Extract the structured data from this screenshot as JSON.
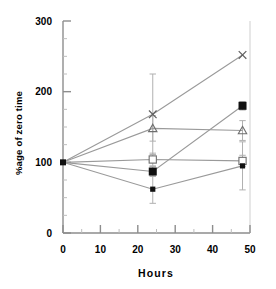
{
  "chart_data": {
    "type": "line",
    "title": "",
    "subtitle": "",
    "xlabel": "Hours",
    "ylabel": "%age of zero time",
    "xlim": [
      0,
      50
    ],
    "ylim": [
      0,
      300
    ],
    "xticks": [
      0,
      10,
      20,
      30,
      40,
      50
    ],
    "xtick_labels": [
      "0",
      "10",
      "20",
      "30",
      "40",
      "50"
    ],
    "yticks": [
      0,
      100,
      200,
      300
    ],
    "ytick_labels": [
      "0",
      "100",
      "200",
      "300"
    ],
    "minor_xticks": [
      5,
      15,
      25,
      35,
      45
    ],
    "minor_yticks": [
      25,
      50,
      75,
      125,
      150,
      175,
      225,
      250,
      275
    ],
    "grid": false,
    "legend_position": "none",
    "x": [
      0,
      24,
      48
    ],
    "series": [
      {
        "name": "series-cross",
        "marker": "cross",
        "values": [
          100,
          168,
          252
        ],
        "errors": [
          0,
          57,
          0
        ]
      },
      {
        "name": "series-triangle",
        "marker": "triangle",
        "values": [
          100,
          148,
          145
        ],
        "errors": [
          0,
          18,
          14
        ]
      },
      {
        "name": "series-open-square",
        "marker": "open-square",
        "values": [
          100,
          104,
          102
        ],
        "errors": [
          0,
          9,
          8
        ]
      },
      {
        "name": "series-filled-square-large",
        "marker": "filled-square",
        "values": [
          100,
          87,
          180
        ],
        "errors": [
          0,
          7,
          6
        ]
      },
      {
        "name": "series-filled-square-small",
        "marker": "filled-square-small",
        "values": [
          100,
          62,
          95
        ],
        "errors": [
          0,
          20,
          34
        ]
      }
    ],
    "annotations": []
  },
  "figure": {
    "footnote": ""
  },
  "colors": {
    "axis": "#8d8d8d",
    "line": "#9a9a9a",
    "marker_fill": "#111111",
    "marker_open": "#ffffff",
    "text": "#000000"
  }
}
